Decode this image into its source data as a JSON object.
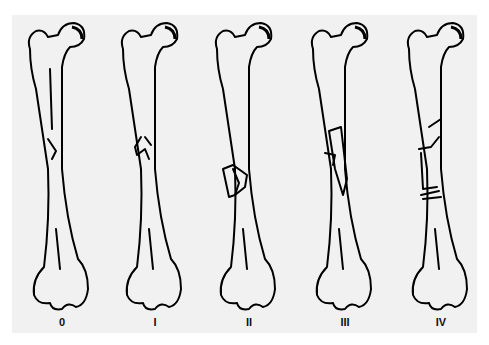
{
  "figure": {
    "type": "femoral shaft fracture classification diagram",
    "background": "#f1f1f1",
    "ink": "#000000",
    "stages": [
      {
        "label": "0",
        "x": 10
      },
      {
        "label": "I",
        "x": 103
      },
      {
        "label": "II",
        "x": 197
      },
      {
        "label": "III",
        "x": 293
      },
      {
        "label": "IV",
        "x": 389
      }
    ]
  }
}
